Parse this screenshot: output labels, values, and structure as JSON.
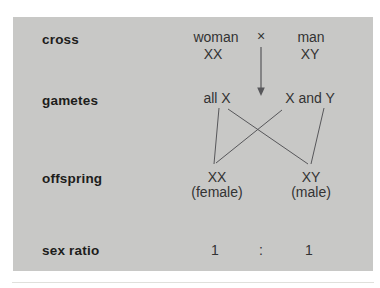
{
  "colors": {
    "page_bg": "#ffffff",
    "panel_bg": "#c8c8c6",
    "label_color": "#1d1d1b",
    "text_color": "#333333",
    "line_color": "#57575a",
    "rule_color": "#e0e0dc"
  },
  "cross_row": {
    "label": "cross",
    "mother_name": "woman",
    "mother_genotype": "XX",
    "cross_symbol": "×",
    "father_name": "man",
    "father_genotype": "XY"
  },
  "gametes_row": {
    "label": "gametes",
    "mother_gametes": "all X",
    "father_gametes": "X and Y"
  },
  "offspring_row": {
    "label": "offspring",
    "female_genotype": "XX",
    "female_label": "(female)",
    "male_genotype": "XY",
    "male_label": "(male)"
  },
  "sex_ratio_row": {
    "label": "sex ratio",
    "female_ratio": "1",
    "separator": ":",
    "male_ratio": "1"
  }
}
